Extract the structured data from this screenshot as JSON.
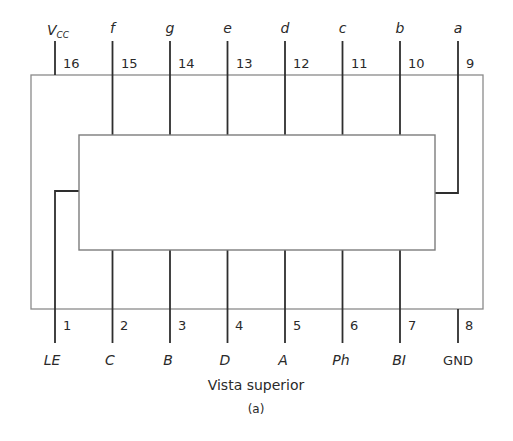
{
  "diagram": {
    "type": "ic-pinout",
    "caption": "Vista superior",
    "subcaption": "(a)",
    "colors": {
      "outline": "#8a8a8a",
      "pin": "#2e2e2e",
      "text": "#2a2a2a"
    },
    "top_pins": [
      {
        "number": "16",
        "signal": "V",
        "signal_sub": "CC"
      },
      {
        "number": "15",
        "signal": "f"
      },
      {
        "number": "14",
        "signal": "g"
      },
      {
        "number": "13",
        "signal": "e"
      },
      {
        "number": "12",
        "signal": "d"
      },
      {
        "number": "11",
        "signal": "c"
      },
      {
        "number": "10",
        "signal": "b"
      },
      {
        "number": "9",
        "signal": "a"
      }
    ],
    "bottom_pins": [
      {
        "number": "1",
        "signal": "LE"
      },
      {
        "number": "2",
        "signal": "C"
      },
      {
        "number": "3",
        "signal": "B"
      },
      {
        "number": "4",
        "signal": "D"
      },
      {
        "number": "5",
        "signal": "A"
      },
      {
        "number": "6",
        "signal": "Ph"
      },
      {
        "number": "7",
        "signal": "BI"
      },
      {
        "number": "8",
        "signal": "GND"
      }
    ]
  }
}
